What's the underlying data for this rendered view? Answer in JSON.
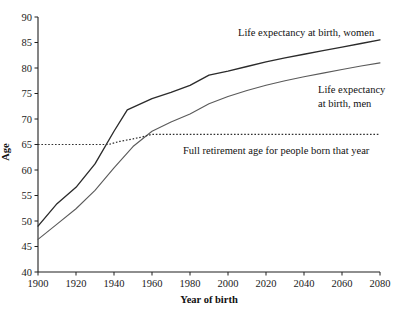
{
  "chart_data": {
    "type": "line",
    "title": "",
    "xlabel": "Year of birth",
    "ylabel": "Age",
    "xlim": [
      1900,
      2080
    ],
    "ylim": [
      40,
      90
    ],
    "xticks": [
      1900,
      1920,
      1940,
      1960,
      1980,
      2000,
      2020,
      2040,
      2060,
      2080
    ],
    "yticks": [
      40,
      45,
      50,
      55,
      60,
      65,
      70,
      75,
      80,
      85,
      90
    ],
    "grid": false,
    "legend_position": "inline-annotations",
    "series": [
      {
        "name": "Life expectancy at birth, women",
        "style": "solid",
        "color": "#2b2b2b",
        "x": [
          1900,
          1910,
          1920,
          1930,
          1940,
          1947,
          1960,
          1970,
          1980,
          1990,
          2000,
          2010,
          2020,
          2030,
          2040,
          2050,
          2060,
          2070,
          2080
        ],
        "y": [
          49.0,
          53.4,
          56.6,
          61.2,
          67.6,
          71.8,
          74.0,
          75.2,
          76.6,
          78.6,
          79.4,
          80.3,
          81.2,
          82.0,
          82.7,
          83.4,
          84.1,
          84.8,
          85.5
        ]
      },
      {
        "name": "Life expectancy at birth, men",
        "style": "solid",
        "color": "#5a5a5a",
        "x": [
          1900,
          1910,
          1920,
          1930,
          1940,
          1950,
          1960,
          1970,
          1980,
          1990,
          2000,
          2010,
          2020,
          2030,
          2040,
          2050,
          2060,
          2070,
          2080
        ],
        "y": [
          46.4,
          49.4,
          52.4,
          56.0,
          60.4,
          64.6,
          67.6,
          69.4,
          71.0,
          73.0,
          74.4,
          75.6,
          76.6,
          77.5,
          78.3,
          79.0,
          79.7,
          80.4,
          81.0
        ]
      },
      {
        "name": "Full retirement age for people born that year",
        "style": "dotted",
        "color": "#303030",
        "x": [
          1900,
          1937,
          1943,
          1950,
          1955,
          1960,
          1970,
          1980,
          2000,
          2020,
          2040,
          2060,
          2080
        ],
        "y": [
          65.0,
          65.0,
          65.6,
          66.1,
          66.5,
          67.0,
          67.0,
          67.0,
          67.0,
          67.0,
          67.0,
          67.0,
          67.0
        ]
      }
    ],
    "annotations": [
      {
        "id": "women-label",
        "text": "Life expectancy at birth, women",
        "x": 238,
        "y": 36,
        "anchor": "start"
      },
      {
        "id": "men-label-line1",
        "text": "Life expectancy",
        "x": 318,
        "y": 93,
        "anchor": "start"
      },
      {
        "id": "men-label-line2",
        "text": "at birth, men",
        "x": 318,
        "y": 107,
        "anchor": "start"
      },
      {
        "id": "retirement-label",
        "text": "Full retirement age for people born that year",
        "x": 183,
        "y": 154,
        "anchor": "start"
      }
    ]
  }
}
